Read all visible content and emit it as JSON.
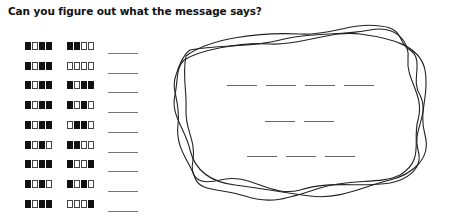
{
  "title": "Can you figure out what the message says?",
  "legend": {
    "on": "filled-square",
    "off": "empty-square"
  },
  "code_rows": [
    {
      "left": [
        1,
        0,
        1,
        1
      ],
      "right": [
        1,
        1,
        0,
        0
      ],
      "answer": ""
    },
    {
      "left": [
        1,
        0,
        1,
        1
      ],
      "right": [
        0,
        0,
        0,
        0
      ],
      "answer": ""
    },
    {
      "left": [
        1,
        0,
        1,
        1
      ],
      "right": [
        1,
        0,
        1,
        1
      ],
      "answer": ""
    },
    {
      "left": [
        1,
        0,
        1,
        1
      ],
      "right": [
        1,
        0,
        1,
        0
      ],
      "answer": ""
    },
    {
      "left": [
        1,
        0,
        1,
        1
      ],
      "right": [
        0,
        1,
        1,
        0
      ],
      "answer": ""
    },
    {
      "left": [
        1,
        0,
        1,
        0
      ],
      "right": [
        1,
        1,
        0,
        0
      ],
      "answer": ""
    },
    {
      "left": [
        1,
        0,
        1,
        1
      ],
      "right": [
        1,
        0,
        0,
        1
      ],
      "answer": ""
    },
    {
      "left": [
        1,
        0,
        1,
        0
      ],
      "right": [
        1,
        0,
        1,
        0
      ],
      "answer": ""
    },
    {
      "left": [
        1,
        0,
        1,
        1
      ],
      "right": [
        0,
        0,
        0,
        1
      ],
      "answer": ""
    }
  ],
  "message": {
    "lines": [
      {
        "blanks": 4
      },
      {
        "blanks": 2
      },
      {
        "blanks": 3
      }
    ]
  },
  "colors": {
    "ink": "#111111",
    "blank_line": "#777777",
    "background": "#ffffff"
  }
}
